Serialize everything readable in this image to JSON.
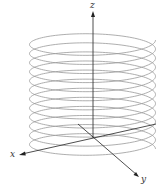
{
  "diagram": {
    "type": "3d-helix",
    "axes": {
      "x": {
        "label": "x"
      },
      "y": {
        "label": "y"
      },
      "z": {
        "label": "z"
      }
    },
    "helix": {
      "turns": 12,
      "color": "#999999"
    },
    "axis_color": "#222222"
  }
}
